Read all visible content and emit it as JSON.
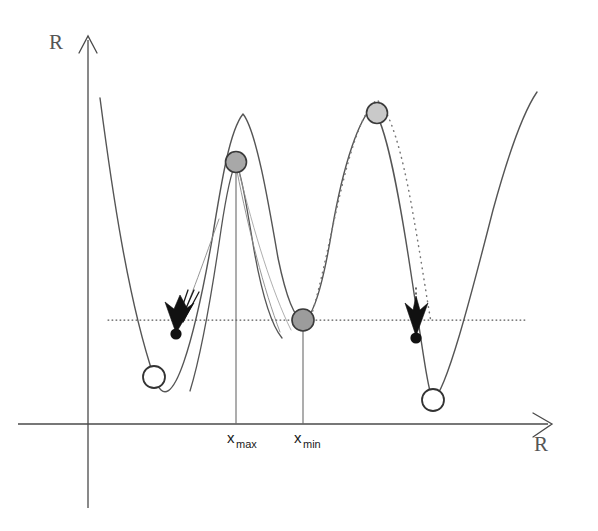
{
  "figure": {
    "background_color": "#ffffff",
    "axes": {
      "y_axis_label": "R",
      "x_axis_label": "R",
      "origin": {
        "x": 88,
        "y": 424
      },
      "y_axis_top": {
        "x": 88,
        "y": 36
      },
      "y_axis_bottom": {
        "x": 88,
        "y": 508
      },
      "x_axis_left": {
        "x": 18,
        "y": 424
      },
      "x_axis_right": {
        "x": 548,
        "y": 424
      },
      "axis_color": "#4a4a4a"
    },
    "tick_labels": [
      {
        "base": "x",
        "sub": "max",
        "x": 236,
        "y": 443
      },
      {
        "base": "x",
        "sub": "min",
        "x": 303,
        "y": 443
      }
    ],
    "threshold_line": {
      "y": 320,
      "x_start": 108,
      "x_end": 527,
      "style": "dotted",
      "color": "#555555"
    },
    "drop_lines": [
      {
        "x": 236,
        "y_top": 162,
        "y_bottom": 424,
        "label": "x_max"
      },
      {
        "x": 303,
        "y_top": 320,
        "y_bottom": 424,
        "label": "x_min"
      }
    ],
    "markers": {
      "gray_circles": [
        {
          "name": "peak-marker-mid",
          "cx": 236,
          "cy": 162,
          "r": 10.5,
          "fill": "#a8a8a8",
          "stroke": "#3a3a3a"
        },
        {
          "name": "valley-marker-center",
          "cx": 303,
          "cy": 320,
          "r": 11,
          "fill": "#9c9c9c",
          "stroke": "#3a3a3a"
        },
        {
          "name": "peak-marker-right",
          "cx": 377,
          "cy": 113,
          "r": 10.5,
          "fill": "#c9c9c9",
          "stroke": "#3a3a3a"
        }
      ],
      "hollow_circles": [
        {
          "name": "minimum-marker-left",
          "cx": 154,
          "cy": 377,
          "r": 11,
          "fill": "#ffffff",
          "stroke": "#333333"
        },
        {
          "name": "minimum-marker-right",
          "cx": 433,
          "cy": 400,
          "r": 11,
          "fill": "#ffffff",
          "stroke": "#333333"
        }
      ],
      "filled_dots": [
        {
          "name": "transition-dot-left",
          "cx": 176,
          "cy": 334,
          "r": 5.5,
          "fill": "#111111"
        },
        {
          "name": "transition-dot-right",
          "cx": 416,
          "cy": 338,
          "r": 5.5,
          "fill": "#111111"
        }
      ]
    },
    "arrows": [
      {
        "name": "descent-arrow-left",
        "tip_x": 176,
        "tip_y": 331,
        "angle_deg": 10
      },
      {
        "name": "descent-arrow-right",
        "tip_x": 416,
        "tip_y": 335,
        "angle_deg": 0
      }
    ],
    "curves": {
      "outer_solid": {
        "name": "outer-potential-curve",
        "color": "#555555",
        "width": 1.4,
        "description": "main double-well potential with three peaks"
      },
      "inner_solid": {
        "name": "inner-potential-curve",
        "color": "#555555",
        "width": 1.4,
        "description": "narrower shifted peak through x_max marker"
      },
      "dotted": {
        "name": "dotted-potential-curve",
        "color": "#777777",
        "width": 1.4,
        "description": "dotted arc above the right peak"
      }
    }
  }
}
